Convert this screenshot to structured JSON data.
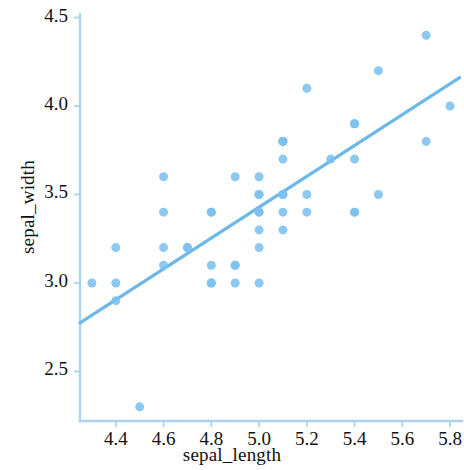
{
  "chart_data": {
    "type": "scatter",
    "title": "",
    "xlabel": "sepal_length",
    "ylabel": "sepal_width",
    "xlim": [
      4.25,
      5.85
    ],
    "ylim": [
      2.22,
      4.52
    ],
    "xticks": [
      "4.4",
      "4.6",
      "4.8",
      "5.0",
      "5.2",
      "5.4",
      "5.6",
      "5.8"
    ],
    "xtick_values": [
      4.4,
      4.6,
      4.8,
      5.0,
      5.2,
      5.4,
      5.6,
      5.8
    ],
    "yticks": [
      "2.5",
      "3.0",
      "3.5",
      "4.0",
      "4.5"
    ],
    "ytick_values": [
      2.5,
      3.0,
      3.5,
      4.0,
      4.5
    ],
    "grid": false,
    "legend": null,
    "point_color": "#7cc0ee",
    "line_color": "#6cb8e8",
    "axis_color": "#aad4ef",
    "text_color": "#111111",
    "marker_size": 9,
    "series": [
      {
        "name": "sepal_width vs sepal_length",
        "x": [
          5.1,
          4.9,
          4.7,
          4.6,
          5.0,
          5.4,
          4.6,
          5.0,
          4.4,
          4.9,
          5.4,
          4.8,
          4.8,
          4.3,
          5.8,
          5.7,
          5.4,
          5.1,
          5.7,
          5.1,
          5.4,
          5.1,
          4.6,
          5.1,
          4.8,
          5.0,
          5.0,
          5.2,
          5.2,
          4.7,
          4.8,
          5.4,
          5.2,
          5.5,
          4.9,
          5.0,
          5.5,
          4.9,
          4.4,
          5.1,
          5.0,
          4.5,
          4.4,
          5.0,
          5.1,
          4.8,
          5.1,
          4.6,
          5.3,
          5.0
        ],
        "y": [
          3.5,
          3.0,
          3.2,
          3.1,
          3.6,
          3.9,
          3.4,
          3.4,
          2.9,
          3.1,
          3.7,
          3.4,
          3.0,
          3.0,
          4.0,
          4.4,
          3.9,
          3.5,
          3.8,
          3.8,
          3.4,
          3.7,
          3.6,
          3.3,
          3.4,
          3.0,
          3.4,
          3.5,
          3.4,
          3.2,
          3.1,
          3.4,
          4.1,
          4.2,
          3.1,
          3.2,
          3.5,
          3.6,
          3.0,
          3.4,
          3.5,
          2.3,
          3.2,
          3.5,
          3.8,
          3.0,
          3.8,
          3.2,
          3.7,
          3.3
        ]
      }
    ],
    "regression_line": {
      "x_start": 4.25,
      "y_start": 2.775,
      "x_end": 5.84,
      "y_end": 4.16
    }
  },
  "axes": {
    "x_axis_name": "sepal_length",
    "y_axis_name": "sepal_width"
  }
}
